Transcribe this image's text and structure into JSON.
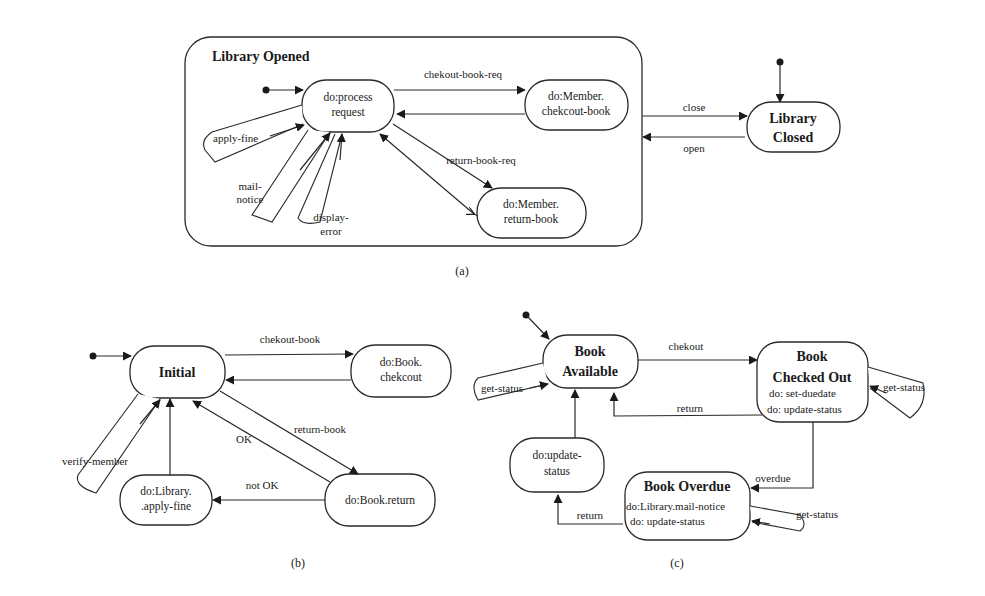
{
  "figure": {
    "captions": {
      "a": "(a)",
      "b": "(b)",
      "c": "(c)"
    }
  },
  "diagram_a": {
    "composite_state": "Library Opened",
    "states": {
      "process_request": [
        "do:process",
        "request"
      ],
      "member_checkout": [
        "do:Member.",
        "chekcout-book"
      ],
      "member_return": [
        "do:Member.",
        "return-book"
      ],
      "library_closed": [
        "Library",
        "Closed"
      ]
    },
    "transitions": {
      "checkout_req": "chekout-book-req",
      "return_req": "return-book-req",
      "apply_fine": "apply-fine",
      "mail_notice": [
        "mail-",
        "notice"
      ],
      "display_error": [
        "display-",
        "error"
      ],
      "close": "close",
      "open": "open"
    }
  },
  "diagram_b": {
    "states": {
      "initial": "Initial",
      "book_checkout": [
        "do:Book.",
        "chekcout"
      ],
      "book_return": "do:Book.return",
      "apply_fine": [
        "do:Library.",
        ".apply-fine"
      ]
    },
    "transitions": {
      "checkout_book": "chekout-book",
      "return_book": "return-book",
      "ok": "OK",
      "not_ok": "not OK",
      "verify_member": "verify-member"
    }
  },
  "diagram_c": {
    "states": {
      "available": [
        "Book",
        "Available"
      ],
      "checked_out": {
        "title": [
          "Book",
          "Checked Out"
        ],
        "actions": [
          "do: set-duedate",
          "do: update-status"
        ]
      },
      "overdue": {
        "title": "Book Overdue",
        "actions": [
          "do:Library.mail-notice",
          "do: update-status"
        ]
      },
      "update_status": [
        "do:update-",
        "status"
      ]
    },
    "transitions": {
      "checkout": "chekout",
      "return_to_available": "return",
      "return_from_overdue": "return",
      "overdue": "overdue",
      "get_status_available": "get-status",
      "get_status_checked_out": "get-status",
      "get_status_overdue": "get-status"
    }
  }
}
